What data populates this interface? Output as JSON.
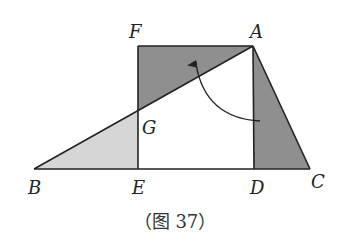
{
  "figure": {
    "caption": "（图 37）",
    "colors": {
      "dark_shade": "#8f8f8f",
      "light_shade": "#d6d6d6",
      "stroke": "#222222",
      "background": "#ffffff"
    },
    "points": {
      "A": {
        "label": "A",
        "x": 253,
        "y": 46
      },
      "F": {
        "label": "F",
        "x": 138,
        "y": 46
      },
      "G": {
        "label": "G",
        "x": 138,
        "y": 111
      },
      "B": {
        "label": "B",
        "x": 34,
        "y": 169
      },
      "E": {
        "label": "E",
        "x": 138,
        "y": 169
      },
      "D": {
        "label": "D",
        "x": 254,
        "y": 169
      },
      "C": {
        "label": "C",
        "x": 310,
        "y": 169
      }
    },
    "shapes": {
      "triangle_AFG": "dark",
      "triangle_ADC": "dark",
      "triangle_BEG": "light"
    },
    "arrow": {
      "from": "AD near D-side",
      "to": "triangle AFG",
      "type": "curved-rotation"
    }
  }
}
